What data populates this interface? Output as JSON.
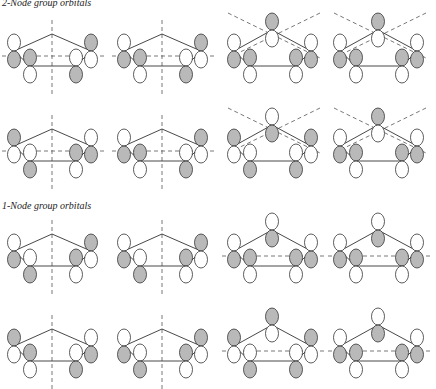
{
  "sections": [
    {
      "title": "2-Node group orbitals"
    },
    {
      "title": "1-Node group orbitals"
    }
  ],
  "colors": {
    "shaded": "#b9b9b9",
    "open": "#ffffff",
    "stroke": "#333333",
    "node": "#555555"
  },
  "panels": [
    {
      "x": 0,
      "y": 0,
      "apex": null,
      "lo": "down",
      "li": "up",
      "ri": "down",
      "ro": "up",
      "nodes": [
        "h",
        "v"
      ]
    },
    {
      "x": 110,
      "y": 0,
      "apex": null,
      "lo": "down",
      "li": "up",
      "ri": "down",
      "ro": "up",
      "nodes": [
        "h",
        "v"
      ]
    },
    {
      "x": 220,
      "y": 0,
      "apex": "up",
      "lo": "down",
      "li": "up",
      "ri": "up",
      "ro": "down",
      "nodes": [
        "d1",
        "d2"
      ]
    },
    {
      "x": 326,
      "y": 0,
      "apex": "up",
      "lo": "down",
      "li": "up",
      "ri": "up",
      "ro": "down",
      "nodes": [
        "d1",
        "d2"
      ]
    },
    {
      "x": 0,
      "y": 95,
      "apex": null,
      "lo": "up",
      "li": "down",
      "ri": "up",
      "ro": "down",
      "nodes": [
        "h",
        "v"
      ]
    },
    {
      "x": 110,
      "y": 95,
      "apex": null,
      "lo": "down",
      "li": "up",
      "ri": "down",
      "ro": "up",
      "nodes": [
        "h",
        "v"
      ]
    },
    {
      "x": 220,
      "y": 95,
      "apex": "down",
      "lo": "up",
      "li": "down",
      "ri": "down",
      "ro": "up",
      "nodes": [
        "d1",
        "d2"
      ]
    },
    {
      "x": 326,
      "y": 95,
      "apex": "up",
      "lo": "down",
      "li": "up",
      "ri": "up",
      "ro": "down",
      "nodes": [
        "d1",
        "d2"
      ]
    },
    {
      "x": 0,
      "y": 200,
      "apex": null,
      "lo": "down",
      "li": "down",
      "ri": "up",
      "ro": "up",
      "nodes": [
        "v"
      ]
    },
    {
      "x": 110,
      "y": 200,
      "apex": null,
      "lo": "down",
      "li": "down",
      "ri": "up",
      "ro": "up",
      "nodes": [
        "v"
      ]
    },
    {
      "x": 220,
      "y": 200,
      "apex": "down",
      "lo": "down",
      "li": "up",
      "ri": "up",
      "ro": "down",
      "nodes": [
        "h"
      ]
    },
    {
      "x": 326,
      "y": 200,
      "apex": "down",
      "lo": "down",
      "li": "up",
      "ri": "up",
      "ro": "down",
      "nodes": [
        "h"
      ]
    },
    {
      "x": 0,
      "y": 295,
      "apex": null,
      "lo": "up",
      "li": "up",
      "ri": "down",
      "ro": "down",
      "nodes": [
        "v"
      ]
    },
    {
      "x": 110,
      "y": 295,
      "apex": null,
      "lo": "down",
      "li": "down",
      "ri": "up",
      "ro": "up",
      "nodes": [
        "v"
      ]
    },
    {
      "x": 220,
      "y": 295,
      "apex": "up",
      "lo": "up",
      "li": "down",
      "ri": "down",
      "ro": "up",
      "nodes": [
        "h"
      ]
    },
    {
      "x": 326,
      "y": 295,
      "apex": "down",
      "lo": "down",
      "li": "up",
      "ri": "up",
      "ro": "down",
      "nodes": [
        "h"
      ]
    }
  ]
}
